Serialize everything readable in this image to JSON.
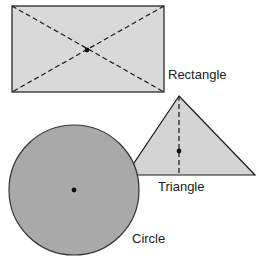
{
  "diagram": {
    "shapes": [
      {
        "name": "Rectangle",
        "label": "Rectangle",
        "fill": "#d9d9d9",
        "center_marked": true
      },
      {
        "name": "Triangle",
        "label": "Triangle",
        "fill": "#d4d4d4",
        "center_marked": true
      },
      {
        "name": "Circle",
        "label": "Circle",
        "fill": "#a9a9a9",
        "center_marked": true
      }
    ],
    "colors": {
      "stroke": "#1a1a1a",
      "background": "#ffffff"
    }
  }
}
